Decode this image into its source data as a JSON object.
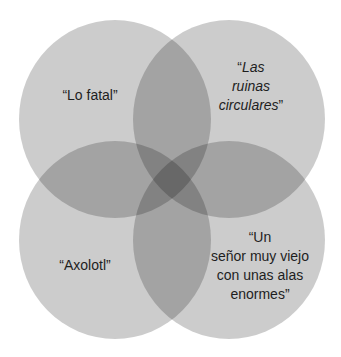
{
  "diagram": {
    "type": "four-circle-venn",
    "colors": {
      "background": "#ffffff",
      "circle_fill": "#000000",
      "circle_opacity": 0.2,
      "text": "#1e1e1e"
    },
    "circles": [
      {
        "id": "top-left",
        "label_lines": [
          "“Lo fatal”"
        ],
        "italic": false
      },
      {
        "id": "top-right",
        "open_quote": "“",
        "label_lines": [
          "Las",
          "ruinas",
          "circulares"
        ],
        "close_quote": "”",
        "italic": true
      },
      {
        "id": "bottom-left",
        "label_lines": [
          "“Axolotl”"
        ],
        "italic": false
      },
      {
        "id": "bottom-right",
        "label_lines": [
          "“Un",
          "señor muy viejo",
          "con unas alas",
          "enormes”"
        ],
        "italic": false
      }
    ]
  }
}
